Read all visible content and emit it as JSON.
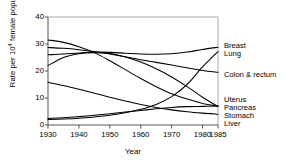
{
  "chart_data": {
    "type": "line",
    "title": "",
    "xlabel": "Year",
    "ylabel_prefix": "Rate per 10",
    "ylabel_sup": "4",
    "ylabel_suffix": " female population",
    "xlim": [
      1930,
      1985
    ],
    "ylim": [
      0,
      40
    ],
    "yticks": [
      0,
      10,
      20,
      30,
      40
    ],
    "xticks": [
      1930,
      1940,
      1950,
      1960,
      1970,
      1980,
      1985
    ],
    "grid": false,
    "legend_position": "right-inline",
    "x": [
      1930,
      1935,
      1940,
      1945,
      1950,
      1955,
      1960,
      1965,
      1970,
      1975,
      1980,
      1985
    ],
    "series": [
      {
        "name": "Breast",
        "label": "Breast",
        "color": "#000000",
        "values": [
          26.0,
          26.3,
          26.7,
          27.0,
          26.9,
          26.6,
          26.3,
          26.2,
          26.4,
          27.0,
          28.0,
          28.8
        ]
      },
      {
        "name": "Lung",
        "label": "Lung",
        "color": "#000000",
        "values": [
          2.0,
          2.2,
          2.5,
          3.0,
          3.6,
          4.5,
          5.8,
          7.6,
          10.5,
          15.0,
          21.5,
          27.2
        ]
      },
      {
        "name": "Colon & rectum",
        "label": "Colon & rectum",
        "color": "#000000",
        "values": [
          28.7,
          28.4,
          27.9,
          27.2,
          26.3,
          25.3,
          24.2,
          23.2,
          22.2,
          21.2,
          20.2,
          19.5
        ]
      },
      {
        "name": "Uterus",
        "label": "Uterus",
        "color": "#000000",
        "values": [
          31.5,
          30.6,
          29.0,
          26.8,
          23.8,
          20.5,
          17.2,
          14.2,
          11.6,
          9.6,
          8.0,
          7.0
        ]
      },
      {
        "name": "Pancreas",
        "label": "Pancreas",
        "color": "#000000",
        "values": [
          2.4,
          2.7,
          3.1,
          3.6,
          4.2,
          4.8,
          5.4,
          6.0,
          6.5,
          6.8,
          6.9,
          7.0
        ]
      },
      {
        "name": "Stomach",
        "label": "Stomach",
        "color": "#000000",
        "values": [
          15.8,
          14.6,
          13.2,
          11.8,
          10.3,
          8.9,
          7.6,
          6.5,
          5.6,
          4.9,
          4.4,
          4.0
        ]
      },
      {
        "name": "Liver",
        "label": "Liver",
        "color": "#000000",
        "values": [
          22.0,
          25.0,
          26.4,
          26.8,
          26.5,
          25.2,
          23.3,
          20.8,
          17.8,
          14.2,
          10.3,
          6.8
        ]
      }
    ],
    "series_labels": [
      {
        "label": "Breast",
        "y_px": 47
      },
      {
        "label": "Lung",
        "y_px": 55
      },
      {
        "label": "Colon & rectum",
        "y_px": 76
      },
      {
        "label": "Uterus",
        "y_px": 101
      },
      {
        "label": "Pancreas",
        "y_px": 109
      },
      {
        "label": "Stomach",
        "y_px": 117
      },
      {
        "label": "Liver",
        "y_px": 125
      }
    ]
  }
}
